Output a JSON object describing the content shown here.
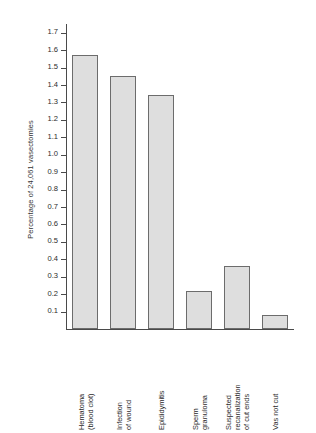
{
  "chart_data": {
    "type": "bar",
    "title": "",
    "subtitle": "",
    "xlabel": "",
    "ylabel": "Percentage of 24,061 vasectomies",
    "ylim": [
      0,
      1.75
    ],
    "grid": false,
    "legend": null,
    "yticks": [
      "1.7",
      "1.6",
      "1.5",
      "1.4",
      "1.3",
      "1.2",
      "1.1",
      "1.0",
      "0.9",
      "0.8",
      "0.7",
      "0.6",
      "0.5",
      "0.4",
      "0.3",
      "0.2",
      "0.1"
    ],
    "ytick_values": [
      1.7,
      1.6,
      1.5,
      1.4,
      1.3,
      1.2,
      1.1,
      1.0,
      0.9,
      0.8,
      0.7,
      0.6,
      0.5,
      0.4,
      0.3,
      0.2,
      0.1
    ],
    "categories": [
      "Hematoma\n(blood clot)",
      "Infection\nof wound",
      "Epididymitis",
      "Sperm\ngranuloma",
      "Suspected\nrecanalization\nof cut ends",
      "Vas not cut"
    ],
    "category_lines": [
      [
        "Hematoma",
        "(blood clot)"
      ],
      [
        "Infection",
        "of wound"
      ],
      [
        "Epididymitis"
      ],
      [
        "Sperm",
        "granuloma"
      ],
      [
        "Suspected",
        "recanalization",
        "of cut ends"
      ],
      [
        "Vas not cut"
      ]
    ],
    "values": [
      1.57,
      1.45,
      1.34,
      0.22,
      0.36,
      0.08
    ],
    "bar_fill": "#dedede",
    "bar_edge": "#6c6c6c",
    "background": "#ffffff"
  }
}
